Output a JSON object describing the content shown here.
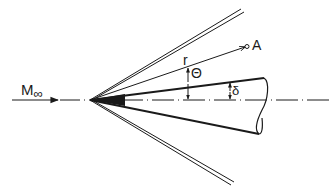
{
  "diagram": {
    "labels": {
      "freestream_mach": "M",
      "freestream_sub": "∞",
      "point": "A",
      "radius": "r",
      "polar_angle": "Θ",
      "cone_half_angle": "δ"
    },
    "colors": {
      "ink": "#1a1a1a",
      "background": "#ffffff"
    },
    "elements": [
      "freestream-arrow",
      "symmetry-axis",
      "upper-shock",
      "lower-shock",
      "cone-body",
      "cone-base-ellipse",
      "radius-ray",
      "theta-arc",
      "delta-arc"
    ]
  }
}
